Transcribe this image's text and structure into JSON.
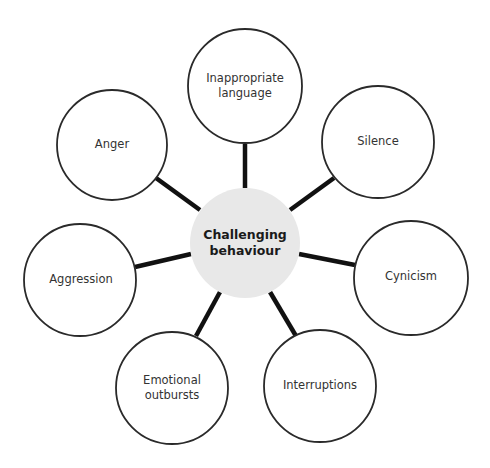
{
  "diagram": {
    "type": "spider-diagram",
    "hub": {
      "label_line1": "Challenging",
      "label_line2": "behaviour",
      "fill": "#e8e8e8"
    },
    "nodes": [
      {
        "id": "inappropriate-language",
        "line1": "Inappropriate",
        "line2": "language"
      },
      {
        "id": "silence",
        "line1": "Silence",
        "line2": ""
      },
      {
        "id": "cynicism",
        "line1": "Cynicism",
        "line2": ""
      },
      {
        "id": "interruptions",
        "line1": "Interruptions",
        "line2": ""
      },
      {
        "id": "emotional-outbursts",
        "line1": "Emotional",
        "line2": "outbursts"
      },
      {
        "id": "aggression",
        "line1": "Aggression",
        "line2": ""
      },
      {
        "id": "anger",
        "line1": "Anger",
        "line2": ""
      }
    ],
    "colors": {
      "spoke": "#111111",
      "node_border": "#2a2a2a",
      "text": "#333333"
    }
  }
}
